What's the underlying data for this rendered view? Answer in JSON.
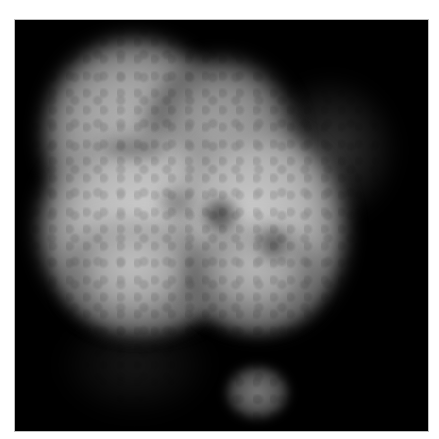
{
  "image": {
    "description": "Grayscale fluorescence micrograph of a lobed cell nucleus on black background",
    "frame": {
      "background": "#000000",
      "border": "#bdbdbd"
    },
    "palette": {
      "bright": "#d8d8d8",
      "mid": "#9a9a9a",
      "dim": "#4a4a4a",
      "background": "#000000"
    }
  }
}
